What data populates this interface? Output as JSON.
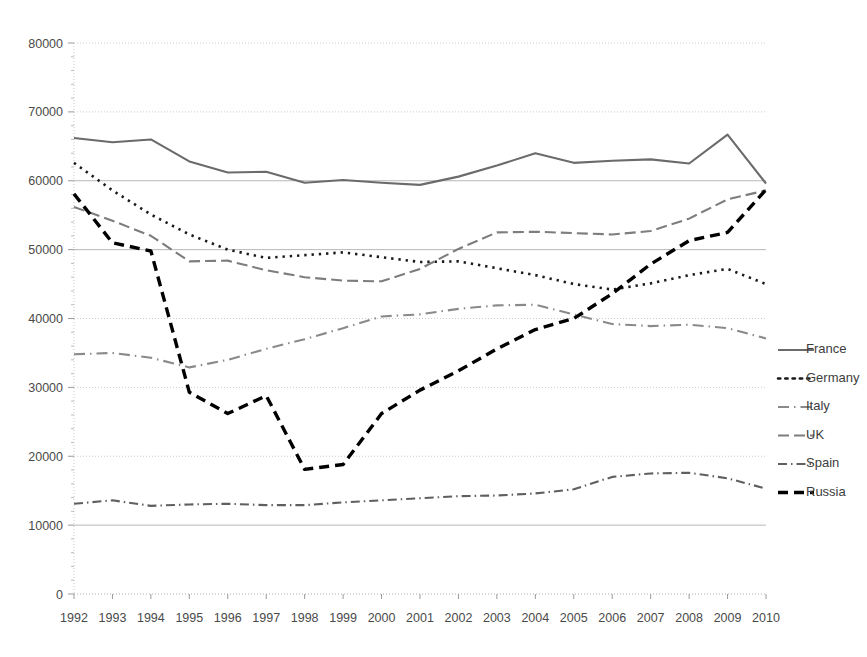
{
  "chart_data": {
    "type": "line",
    "title": "",
    "subtitle": "",
    "xlabel": "",
    "ylabel": "",
    "grid": true,
    "legend_position": "right",
    "ylim": [
      0,
      80000
    ],
    "ytick_step": 10000,
    "ytick_labels": [
      "0",
      "10000",
      "20000",
      "30000",
      "40000",
      "50000",
      "60000",
      "70000",
      "80000"
    ],
    "ytick_values": [
      0,
      10000,
      20000,
      30000,
      40000,
      50000,
      60000,
      70000,
      80000
    ],
    "categories": [
      "1992",
      "1993",
      "1994",
      "1995",
      "1996",
      "1997",
      "1998",
      "1999",
      "2000",
      "2001",
      "2002",
      "2003",
      "2004",
      "2005",
      "2006",
      "2007",
      "2008",
      "2009",
      "2010"
    ],
    "x": [
      1992,
      1993,
      1994,
      1995,
      1996,
      1997,
      1998,
      1999,
      2000,
      2001,
      2002,
      2003,
      2004,
      2005,
      2006,
      2007,
      2008,
      2009,
      2010
    ],
    "series": [
      {
        "name": "France",
        "color": "#6b6b6b",
        "dash": "solid",
        "width": 2.1,
        "values": [
          66200,
          65600,
          66000,
          62800,
          61200,
          61300,
          59700,
          60100,
          59700,
          59400,
          60600,
          62200,
          64000,
          62600,
          62900,
          63100,
          62500,
          66700,
          59600
        ]
      },
      {
        "name": "Germany",
        "color": "#1a1a1a",
        "dash": "dotted",
        "width": 2.6,
        "values": [
          62600,
          58600,
          55100,
          52200,
          50000,
          48800,
          49200,
          49600,
          48900,
          48200,
          48300,
          47300,
          46300,
          45000,
          44200,
          45100,
          46300,
          47200,
          45000
        ]
      },
      {
        "name": "Italy",
        "color": "#8a8a8a",
        "dash": "longdash-dot",
        "width": 2.1,
        "values": [
          34800,
          35000,
          34300,
          32900,
          34000,
          35600,
          37000,
          38600,
          40300,
          40600,
          41400,
          41900,
          42000,
          40600,
          39200,
          38900,
          39100,
          38600,
          37100
        ]
      },
      {
        "name": "UK",
        "color": "#7d7d7d",
        "dash": "longdash",
        "width": 2.1,
        "values": [
          56200,
          54200,
          52000,
          48300,
          48400,
          47000,
          46000,
          45500,
          45400,
          47200,
          50100,
          52500,
          52600,
          52400,
          52200,
          52700,
          54500,
          57300,
          58600
        ]
      },
      {
        "name": "Spain",
        "color": "#5f5f5f",
        "dash": "dashdot",
        "width": 2.1,
        "values": [
          13100,
          13600,
          12800,
          13000,
          13100,
          12900,
          12900,
          13300,
          13600,
          13900,
          14200,
          14300,
          14600,
          15200,
          17000,
          17500,
          17600,
          16800,
          15300
        ]
      },
      {
        "name": "Russia",
        "color": "#000000",
        "dash": "heavydash",
        "width": 3.4,
        "values": [
          58100,
          51000,
          49800,
          29300,
          26200,
          28800,
          18100,
          18800,
          26200,
          29600,
          32400,
          35600,
          38400,
          40000,
          43600,
          47900,
          51300,
          52500,
          58700
        ]
      }
    ]
  },
  "legend": {
    "items": [
      {
        "label": "France"
      },
      {
        "label": "Germany"
      },
      {
        "label": "Italy"
      },
      {
        "label": "UK"
      },
      {
        "label": "Spain"
      },
      {
        "label": "Russia"
      }
    ]
  },
  "colors": {
    "background": "#ffffff",
    "gridline_major": "#b7b7b7",
    "gridline_minor": "#cccccc",
    "text": "#4a4a4a"
  }
}
